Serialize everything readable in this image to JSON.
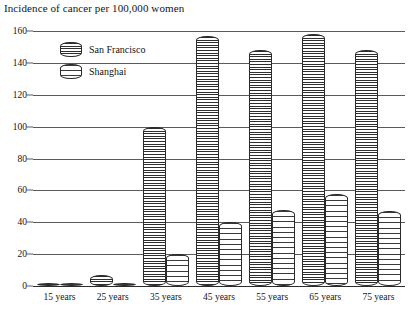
{
  "chart_data": {
    "type": "bar",
    "title": "Incidence of cancer per 100,000 women",
    "xlabel": "",
    "ylabel": "",
    "ylim": [
      0,
      160
    ],
    "yticks": [
      0,
      20,
      40,
      60,
      80,
      100,
      120,
      140,
      160
    ],
    "grid": true,
    "legend_position": "top-left",
    "categories": [
      "15 years",
      "25 years",
      "35 years",
      "45 years",
      "55 years",
      "65 years",
      "75 years"
    ],
    "series": [
      {
        "name": "San Francisco",
        "values": [
          1,
          7,
          100,
          157,
          148,
          158,
          148
        ]
      },
      {
        "name": "Shanghai",
        "values": [
          1,
          2,
          20,
          40,
          48,
          58,
          47
        ]
      }
    ]
  },
  "legend": {
    "items": [
      {
        "label": "San Francisco",
        "swatch": "dense-dark-hatch"
      },
      {
        "label": "Shanghai",
        "swatch": "sparse-light-hatch"
      }
    ]
  },
  "colors": {
    "axis": "#5a5a5a",
    "baseline": "#2a2a2a",
    "text": "#141414",
    "bar_outline": "#2a2a2a",
    "background": "#ffffff"
  }
}
